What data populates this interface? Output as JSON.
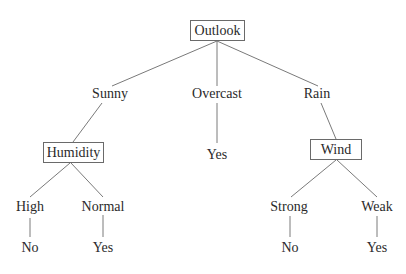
{
  "diagram": {
    "type": "decision-tree",
    "root": {
      "label": "Outlook",
      "branches": [
        {
          "value": "Sunny",
          "node": {
            "label": "Humidity",
            "branches": [
              {
                "value": "High",
                "leaf": "No"
              },
              {
                "value": "Normal",
                "leaf": "Yes"
              }
            ]
          }
        },
        {
          "value": "Overcast",
          "leaf": "Yes"
        },
        {
          "value": "Rain",
          "node": {
            "label": "Wind",
            "branches": [
              {
                "value": "Strong",
                "leaf": "No"
              },
              {
                "value": "Weak",
                "leaf": "Yes"
              }
            ]
          }
        }
      ]
    }
  },
  "colors": {
    "line": "#7a7a7a",
    "text": "#2a2a2a",
    "box_border": "#6a6a6a",
    "background": "#ffffff"
  }
}
